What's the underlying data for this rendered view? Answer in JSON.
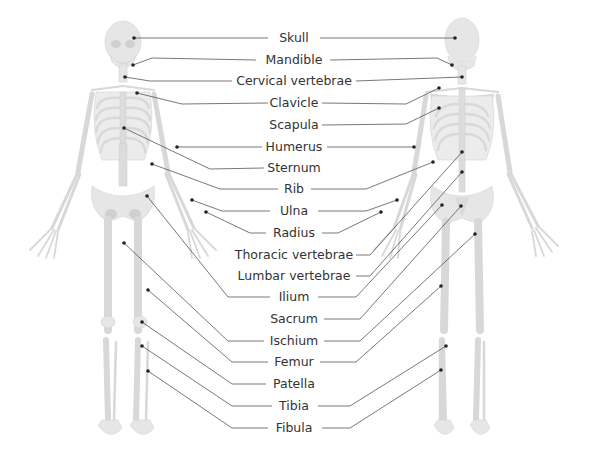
{
  "diagram": {
    "views": [
      "anterior",
      "posterior"
    ],
    "labels": [
      {
        "id": "skull",
        "text": "Skull"
      },
      {
        "id": "mandible",
        "text": "Mandible"
      },
      {
        "id": "cervical",
        "text": "Cervical vertebrae"
      },
      {
        "id": "clavicle",
        "text": "Clavicle"
      },
      {
        "id": "scapula",
        "text": "Scapula"
      },
      {
        "id": "humerus",
        "text": "Humerus"
      },
      {
        "id": "sternum",
        "text": "Sternum"
      },
      {
        "id": "rib",
        "text": "Rib"
      },
      {
        "id": "ulna",
        "text": "Ulna"
      },
      {
        "id": "radius",
        "text": "Radius"
      },
      {
        "id": "thoracic",
        "text": "Thoracic vertebrae"
      },
      {
        "id": "lumbar",
        "text": "Lumbar vertebrae"
      },
      {
        "id": "ilium",
        "text": "Ilium"
      },
      {
        "id": "sacrum",
        "text": "Sacrum"
      },
      {
        "id": "ischium",
        "text": "Ischium"
      },
      {
        "id": "femur",
        "text": "Femur"
      },
      {
        "id": "patella",
        "text": "Patella"
      },
      {
        "id": "tibia",
        "text": "Tibia"
      },
      {
        "id": "fibula",
        "text": "Fibula"
      }
    ],
    "colors": {
      "text": "#333333",
      "leader": "#555555",
      "dot": "#222222",
      "bone": "#e6e6e6"
    }
  }
}
